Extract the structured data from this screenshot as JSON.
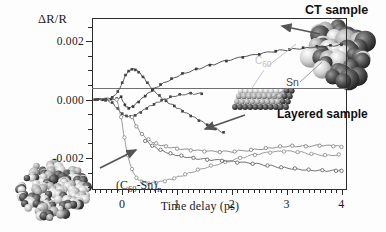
{
  "figure": {
    "y_axis_title": "ΔR/R",
    "x_axis_title": "Time delay (ps)",
    "y_ticks": [
      {
        "value": 0.002,
        "label": "0.002"
      },
      {
        "value": 0.0,
        "label": "0.000"
      },
      {
        "value": -0.002,
        "label": "-0.002"
      }
    ],
    "x_ticks": [
      {
        "value": 0,
        "label": "0"
      },
      {
        "value": 1,
        "label": "1"
      },
      {
        "value": 2,
        "label": "2"
      },
      {
        "value": 3,
        "label": "3"
      },
      {
        "value": 4,
        "label": "4"
      }
    ],
    "annotations": {
      "ct_sample": "CT sample",
      "layered_sample": "Layered sample",
      "c60": "C60",
      "c60_main": "C",
      "c60_sub": "60",
      "sn": "Sn",
      "c60sn_polymer_prefix": "(C",
      "c60sn_polymer_sub1": "60",
      "c60sn_polymer_mid": "-Sn)",
      "c60sn_polymer_sub2": "n"
    },
    "colors": {
      "axis": "#2b2b2b",
      "zero_line": "#6f6f6f",
      "curve_ct": "#3a3a3a",
      "curve_peak": "#444444",
      "curve_dip": "#4a4a4a",
      "curve_c60sn": "#8a8a8a",
      "curve_layered_a": "#7d7d7d",
      "curve_layered_b": "#5a5a5a",
      "arrow": "#555555",
      "leader": "#9a9a9a",
      "label_c60": "#c2c2c2",
      "label_sn": "#4a4a4a"
    }
  },
  "chart_data": {
    "type": "line",
    "title": "",
    "xlabel": "Time delay (ps)",
    "ylabel": "ΔR/R",
    "xlim": [
      -0.55,
      4.1
    ],
    "ylim": [
      -0.0031,
      0.0028
    ],
    "grid": false,
    "legend_position": "in-plot annotations",
    "x_major_ticks": [
      0,
      1,
      2,
      3,
      4
    ],
    "y_major_ticks": [
      0.002,
      0.0,
      -0.002
    ],
    "series": [
      {
        "name": "CT sample",
        "marker": "filled-square",
        "x": [
          -0.5,
          -0.35,
          -0.2,
          -0.1,
          -0.02,
          0.05,
          0.12,
          0.2,
          0.3,
          0.42,
          0.55,
          0.7,
          0.9,
          1.1,
          1.35,
          1.6,
          1.9,
          2.2,
          2.5,
          2.8,
          3.05,
          3.3,
          3.55,
          3.8,
          4.0
        ],
        "y": [
          0.0,
          0.0,
          2e-05,
          4e-05,
          0.0001,
          -0.00018,
          -0.0003,
          -0.00024,
          -8e-05,
          0.00012,
          0.00032,
          0.00052,
          0.00072,
          0.0009,
          0.00105,
          0.00118,
          0.00132,
          0.00145,
          0.00155,
          0.00166,
          0.00172,
          0.00178,
          0.00183,
          0.00186,
          0.00188
        ]
      },
      {
        "name": "peak transient",
        "marker": "filled-square",
        "x": [
          -0.45,
          -0.3,
          -0.18,
          -0.08,
          0.0,
          0.06,
          0.12,
          0.18,
          0.24,
          0.3,
          0.38,
          0.46,
          0.56,
          0.68,
          0.8,
          0.95,
          1.1,
          1.25,
          1.4,
          1.55,
          1.7,
          1.85
        ],
        "y": [
          0.0,
          2e-05,
          8e-05,
          0.00028,
          0.00058,
          0.00084,
          0.00098,
          0.00104,
          0.00102,
          0.00094,
          0.00078,
          0.00058,
          0.00036,
          0.00014,
          -4e-05,
          -0.00022,
          -0.0004,
          -0.00056,
          -0.00072,
          -0.00086,
          -0.001,
          -0.00112
        ]
      },
      {
        "name": "dip transient",
        "marker": "filled-square",
        "x": [
          -0.45,
          -0.3,
          -0.18,
          -0.08,
          0.0,
          0.08,
          0.16,
          0.24,
          0.34,
          0.45,
          0.58,
          0.72,
          0.88,
          1.05,
          1.25,
          1.45
        ],
        "y": [
          0.0,
          -2e-05,
          -0.0001,
          -0.0003,
          -0.00048,
          -0.00056,
          -0.00058,
          -0.00054,
          -0.00044,
          -0.0003,
          -0.00016,
          -2e-05,
          0.0001,
          0.00018,
          0.00022,
          0.0002
        ]
      },
      {
        "name": "(C60-Sn)n",
        "marker": "open-circle",
        "x": [
          -0.1,
          -0.02,
          0.04,
          0.1,
          0.18,
          0.26,
          0.36,
          0.48,
          0.62,
          0.78,
          0.95,
          1.15,
          1.38,
          1.62,
          1.88,
          2.15,
          2.42,
          2.7,
          2.95,
          3.2,
          3.45,
          3.7,
          3.95
        ],
        "y": [
          0.0,
          -0.0006,
          -0.0013,
          -0.0019,
          -0.00238,
          -0.00268,
          -0.00282,
          -0.00288,
          -0.00286,
          -0.0028,
          -0.0027,
          -0.00256,
          -0.0024,
          -0.00226,
          -0.00214,
          -0.002,
          -0.0019,
          -0.00182,
          -0.00178,
          -0.0018,
          -0.00186,
          -0.0019,
          -0.00188
        ]
      },
      {
        "name": "Layered sample upper",
        "marker": "open-circle",
        "x": [
          0.18,
          0.26,
          0.36,
          0.48,
          0.62,
          0.8,
          1.0,
          1.25,
          1.5,
          1.78,
          2.05,
          2.35,
          2.62,
          2.88,
          3.1,
          3.35,
          3.6,
          3.85,
          4.0
        ],
        "y": [
          -0.0006,
          -0.00092,
          -0.00118,
          -0.00136,
          -0.0015,
          -0.0016,
          -0.00168,
          -0.00174,
          -0.00178,
          -0.0018,
          -0.00178,
          -0.00172,
          -0.00166,
          -0.0016,
          -0.00158,
          -0.0016,
          -0.00158,
          -0.0016,
          -0.00162
        ]
      },
      {
        "name": "Layered sample lower",
        "marker": "open-circle",
        "x": [
          0.42,
          0.55,
          0.7,
          0.88,
          1.08,
          1.3,
          1.55,
          1.82,
          2.1,
          2.38,
          2.65,
          2.9,
          3.15,
          3.4,
          3.65,
          3.9,
          4.0
        ],
        "y": [
          -0.00142,
          -0.00158,
          -0.00172,
          -0.00184,
          -0.00192,
          -0.002,
          -0.00206,
          -0.0021,
          -0.00216,
          -0.0022,
          -0.00226,
          -0.00232,
          -0.00236,
          -0.0024,
          -0.00242,
          -0.00244,
          -0.00244
        ]
      }
    ]
  }
}
